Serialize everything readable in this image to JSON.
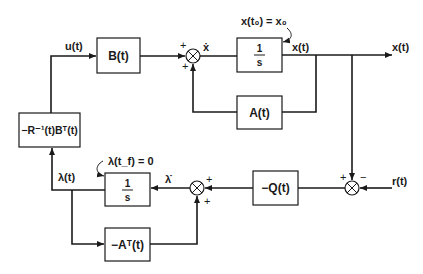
{
  "diagram": {
    "type": "block-diagram",
    "blocks": {
      "B": "B(t)",
      "integrator_state": {
        "num": "1",
        "den": "s"
      },
      "A": "A(t)",
      "gain": "−R⁻¹(t)Bᵀ(t)",
      "Q": "−Q(t)",
      "integrator_costate": {
        "num": "1",
        "den": "s"
      },
      "AT": "−Aᵀ(t)"
    },
    "signals": {
      "u": "u(t)",
      "xdot": "ẋ",
      "x_inner": "x(t)",
      "x_out": "x(t)",
      "r": "r(t)",
      "lambda": "λ(t)",
      "lambdadot": "λ̇"
    },
    "annotations": {
      "initial_condition": "x(t₀) = x₀",
      "final_condition": "λ(t_f) = 0"
    },
    "signs": {
      "top_sum_left": "+",
      "top_sum_bottom": "+",
      "error_sum_top": "+",
      "error_sum_right": "−",
      "costate_sum_right": "+",
      "costate_sum_bottom": "+"
    }
  }
}
